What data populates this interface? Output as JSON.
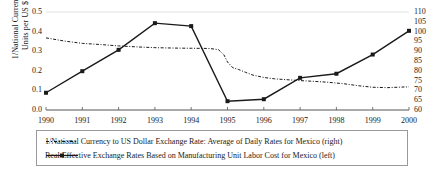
{
  "chart_data": {
    "type": "line",
    "title": "",
    "xlabel": "",
    "ylabel": "1/National Currency Units per US $",
    "ylabel_line1": "1/National Currency",
    "ylabel_line2": "Units per US $",
    "y2label": "",
    "x": [
      1990,
      1991,
      1992,
      1993,
      1994,
      1995,
      1996,
      1997,
      1998,
      1999,
      2000
    ],
    "xlim": [
      1990,
      2000
    ],
    "ylim": [
      0.0,
      0.5
    ],
    "y2lim": [
      60,
      110
    ],
    "grid": false,
    "legend_position": "bottom",
    "yticks": [
      "0.0",
      "0.1",
      "0.2",
      "0.3",
      "0.4",
      "0.5"
    ],
    "ytick_values": [
      0.0,
      0.1,
      0.2,
      0.3,
      0.4,
      0.5
    ],
    "y2ticks": [
      "60",
      "65",
      "70",
      "75",
      "80",
      "85",
      "90",
      "95",
      "100",
      "105",
      "110"
    ],
    "y2tick_values": [
      60,
      65,
      70,
      75,
      80,
      85,
      90,
      95,
      100,
      105,
      110
    ],
    "xticks": [
      "1990",
      "1991",
      "1992",
      "1993",
      "1994",
      "1995",
      "1996",
      "1997",
      "1998",
      "1999",
      "2000"
    ],
    "series": [
      {
        "name": "1/National Currency to US Dollar Exchange Rate: Average of Daily Rates for Mexico (right)",
        "short_name": "exchange-rate-daily-average",
        "axis": "left",
        "style": "dash-dot",
        "color": "#1a1a1a",
        "marker": "none",
        "x": [
          1990.0,
          1990.5,
          1991.0,
          1991.5,
          1992.0,
          1992.5,
          1993.0,
          1993.5,
          1994.0,
          1994.5,
          1994.75,
          1994.9,
          1995.0,
          1995.15,
          1995.3,
          1995.5,
          1995.7,
          1996.0,
          1996.3,
          1996.6,
          1997.0,
          1997.4,
          1997.8,
          1998.2,
          1998.6,
          1999.0,
          1999.4,
          1999.8,
          2000.0
        ],
        "values": [
          0.368,
          0.352,
          0.34,
          0.334,
          0.327,
          0.322,
          0.318,
          0.316,
          0.315,
          0.314,
          0.308,
          0.282,
          0.245,
          0.215,
          0.207,
          0.192,
          0.178,
          0.166,
          0.159,
          0.155,
          0.15,
          0.146,
          0.141,
          0.134,
          0.124,
          0.116,
          0.114,
          0.117,
          0.118
        ]
      },
      {
        "name": "Real Effective Exchange Rates Based on Manufacturing Unit Labor Cost for Mexico (left)",
        "short_name": "real-effective-exchange-rate",
        "axis": "right",
        "style": "solid",
        "color": "#1a1a1a",
        "marker": "square",
        "x": [
          1990,
          1991,
          1992,
          1993,
          1994,
          1995,
          1996,
          1997,
          1998,
          1999,
          2000
        ],
        "values": [
          68.8,
          79.8,
          90.7,
          104.3,
          102.8,
          64.5,
          65.5,
          76.4,
          78.5,
          88.3,
          100.4
        ]
      }
    ]
  },
  "legend": {
    "items": [
      {
        "label": "1/National Currency to US Dollar Exchange Rate: Average of Daily Rates for Mexico (right)",
        "style": "dash-dot"
      },
      {
        "label": "Real Effective Exchange Rates Based on Manufacturing Unit Labor Cost for Mexico (left)",
        "style": "solid-marker"
      }
    ]
  }
}
